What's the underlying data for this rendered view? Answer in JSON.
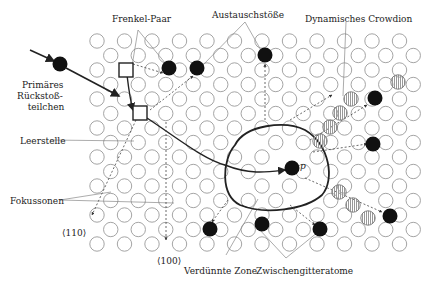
{
  "diagram": {
    "colors": {
      "lattice": "#9a9a9a",
      "atom_black": "#111111",
      "line": "#222222",
      "leader": "#888888",
      "crowdion": "#c8c8c8"
    },
    "lattice": {
      "x0": 97,
      "y0": 41,
      "dx": 27.5,
      "dy": 14.5,
      "rows": 15,
      "cols": 12,
      "r": 7.2
    },
    "labels": {
      "frenkel": "Frenkel-Paar",
      "austausch": "Austauschstöße",
      "crowdion": "Dynamisches Crowdion",
      "primaer_1": "Primäres",
      "primaer_2": "Rückstoß-",
      "primaer_3": "teilchen",
      "leerstelle": "Leerstelle",
      "fokussonen": "Fokussonen",
      "dir110": "⟨110⟩",
      "dir100": "⟨100⟩",
      "verduennt": "Verdünnte Zone",
      "zwischen": "Zwischengitteratome",
      "p": "p"
    },
    "interstitials": [
      [
        169,
        68
      ],
      [
        197,
        68
      ],
      [
        265,
        55
      ],
      [
        375,
        98
      ],
      [
        373,
        144
      ],
      [
        390,
        216
      ],
      [
        320,
        229
      ],
      [
        262,
        224
      ],
      [
        210,
        229
      ]
    ],
    "vacancies": [
      [
        126,
        70
      ],
      [
        140,
        113
      ]
    ],
    "crowdion_atoms": [
      [
        351,
        99
      ],
      [
        340,
        113
      ],
      [
        330,
        127
      ],
      [
        320,
        141
      ],
      [
        398,
        82
      ]
    ],
    "crowdion_lower": [
      [
        339,
        192
      ],
      [
        353,
        205
      ],
      [
        368,
        218
      ]
    ],
    "primary_atom": [
      60,
      64
    ],
    "p_atom": [
      292,
      168
    ]
  }
}
